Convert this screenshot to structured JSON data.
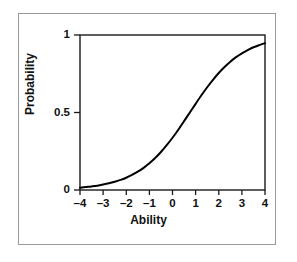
{
  "figure": {
    "frame_color": "#9a9a9a",
    "background": "#ffffff"
  },
  "chart_data": {
    "type": "line",
    "title": "",
    "subtitle": "",
    "xlabel": "Ability",
    "ylabel": "Probability",
    "xlim": [
      -4,
      4
    ],
    "ylim": [
      0,
      1
    ],
    "grid": false,
    "legend": null,
    "legend_position": "none",
    "line_color": "#000000",
    "line_width": 2.0,
    "x_ticks": [
      -4,
      -3,
      -2,
      -1,
      0,
      1,
      2,
      3,
      4
    ],
    "x_tick_labels": [
      "–4",
      "–3",
      "–2",
      "–1",
      "0",
      "1",
      "2",
      "3",
      "4"
    ],
    "y_ticks": [
      0,
      0.5,
      1
    ],
    "y_tick_labels": [
      "0",
      "0.5",
      "1"
    ],
    "curve_model": "logistic item characteristic curve",
    "curve_params": {
      "difficulty_b": 0.7,
      "discrimination_a": 0.85,
      "guessing_c": 0.0
    },
    "series": [
      {
        "name": "Item characteristic curve",
        "x": [
          -4.0,
          -3.75,
          -3.5,
          -3.25,
          -3.0,
          -2.75,
          -2.5,
          -2.25,
          -2.0,
          -1.75,
          -1.5,
          -1.25,
          -1.0,
          -0.75,
          -0.5,
          -0.25,
          0.0,
          0.25,
          0.5,
          0.75,
          1.0,
          1.25,
          1.5,
          1.75,
          2.0,
          2.25,
          2.5,
          2.75,
          3.0,
          3.25,
          3.5,
          3.75,
          4.0
        ],
        "y": [
          0.015,
          0.019,
          0.023,
          0.028,
          0.035,
          0.043,
          0.053,
          0.065,
          0.079,
          0.097,
          0.118,
          0.143,
          0.172,
          0.206,
          0.245,
          0.289,
          0.337,
          0.389,
          0.444,
          0.5,
          0.556,
          0.611,
          0.663,
          0.711,
          0.755,
          0.794,
          0.828,
          0.857,
          0.882,
          0.903,
          0.921,
          0.935,
          0.947
        ]
      }
    ],
    "annotations": []
  },
  "axes": {
    "x_title": "Ability",
    "y_title": "Probability"
  }
}
